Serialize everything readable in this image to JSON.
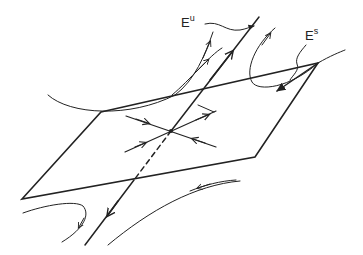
{
  "diagram": {
    "title": "",
    "labels": {
      "unstable": {
        "base": "E",
        "sup": "u"
      },
      "stable": {
        "base": "E",
        "sup": "s"
      }
    },
    "colors": {
      "stroke": "#222222",
      "background": "#ffffff"
    },
    "elements": [
      "parallelogram plane (stable manifold E^s)",
      "unstable line E^u through fixed point",
      "in-plane trajectories toward/away from fixed point",
      "hyperbolic flow curves"
    ]
  }
}
